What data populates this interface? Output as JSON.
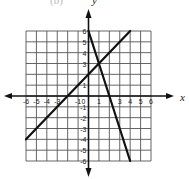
{
  "header": {
    "cropped_text": "(b)",
    "y_axis_letter": "y"
  },
  "chart_data": {
    "type": "line",
    "title": "",
    "xlabel": "x",
    "ylabel": "y",
    "xlim": [
      -6,
      6
    ],
    "ylim": [
      -6,
      6
    ],
    "grid": true,
    "x_ticks": [
      -6,
      -5,
      -4,
      -3,
      -1,
      0,
      1,
      3,
      4,
      5,
      6
    ],
    "y_ticks": [
      6,
      5,
      4,
      3,
      1,
      -1,
      -2,
      -3,
      -4,
      -5,
      -6
    ],
    "series": [
      {
        "name": "line_1",
        "equation": "y = x + 2",
        "points": [
          [
            -6,
            -4
          ],
          [
            4,
            6
          ]
        ]
      },
      {
        "name": "line_2",
        "equation": "y = -3x + 6",
        "points": [
          [
            0,
            6
          ],
          [
            4,
            -6
          ]
        ]
      }
    ],
    "intersection": [
      1,
      3
    ],
    "colors": {
      "grid": "#555555",
      "axes": "#111111",
      "lines": "#111111"
    }
  }
}
